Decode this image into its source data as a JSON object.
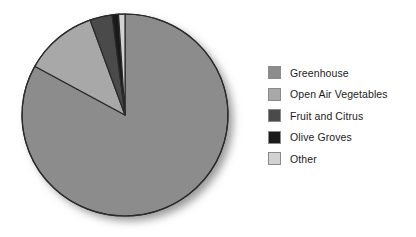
{
  "figure": {
    "background": "#ffffff",
    "width": 416,
    "height": 237
  },
  "legend": {
    "position": "right",
    "items": [
      {
        "label": "Greenhouse",
        "color": "#8c8c8c",
        "swatch_border": "#8a8a8a"
      },
      {
        "label": "Open Air Vegetables",
        "color": "#a8a8a8",
        "swatch_border": "#8a8a8a"
      },
      {
        "label": "Fruit and Citrus",
        "color": "#4a4a4a",
        "swatch_border": "#8a8a8a"
      },
      {
        "label": "Olive Groves",
        "color": "#1a1a1a",
        "swatch_border": "#8a8a8a"
      },
      {
        "label": "Other",
        "color": "#d2d2d2",
        "swatch_border": "#8a8a8a"
      }
    ]
  },
  "pie": {
    "center_x": 125,
    "center_y": 115,
    "radius_x": 103,
    "radius_y": 101,
    "start_angle_deg": -90,
    "outline_color": "#2a2a2a",
    "outline_width": 1.2,
    "has_drop_shadow": true
  },
  "chart_data": {
    "type": "pie",
    "title": "",
    "labels": [
      "Greenhouse",
      "Open Air Vegetables",
      "Fruit and Citrus",
      "Olive Groves",
      "Other"
    ],
    "values": [
      83.0,
      11.5,
      3.5,
      1.0,
      1.0
    ],
    "unit": "percent",
    "colors": [
      "#8c8c8c",
      "#a8a8a8",
      "#4a4a4a",
      "#1a1a1a",
      "#d2d2d2"
    ],
    "start_angle_deg": -90,
    "direction": "clockwise",
    "legend_position": "right",
    "grid": false,
    "xlabel": "",
    "ylabel": ""
  }
}
